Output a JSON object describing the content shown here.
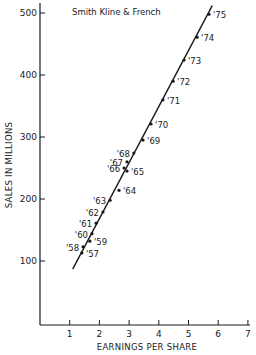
{
  "chart_data": {
    "type": "scatter",
    "title": "Smith Kline & French",
    "xlabel": "EARNINGS PER SHARE",
    "ylabel": "SALES IN MILLIONS",
    "xlim": [
      0,
      7
    ],
    "ylim": [
      0,
      500
    ],
    "xticks": [
      1,
      2,
      3,
      4,
      5,
      6,
      7
    ],
    "yticks": [
      100,
      200,
      300,
      400,
      500
    ],
    "grid": false,
    "legend": null,
    "series": [
      {
        "name": "Smith Kline & French",
        "points": [
          {
            "label": "'57",
            "x": 1.41,
            "y": 113
          },
          {
            "label": "'58",
            "x": 1.45,
            "y": 123
          },
          {
            "label": "'59",
            "x": 1.68,
            "y": 132
          },
          {
            "label": "'60",
            "x": 1.75,
            "y": 144
          },
          {
            "label": "'61",
            "x": 1.89,
            "y": 161
          },
          {
            "label": "'62",
            "x": 2.12,
            "y": 179
          },
          {
            "label": "'63",
            "x": 2.36,
            "y": 198
          },
          {
            "label": "'64",
            "x": 2.66,
            "y": 214
          },
          {
            "label": "'65",
            "x": 2.93,
            "y": 245
          },
          {
            "label": "'66",
            "x": 2.83,
            "y": 250
          },
          {
            "label": "'67",
            "x": 2.93,
            "y": 260
          },
          {
            "label": "'68",
            "x": 3.16,
            "y": 274
          },
          {
            "label": "'69",
            "x": 3.47,
            "y": 295
          },
          {
            "label": "'70",
            "x": 3.74,
            "y": 321
          },
          {
            "label": "'71",
            "x": 4.14,
            "y": 360
          },
          {
            "label": "'72",
            "x": 4.48,
            "y": 390
          },
          {
            "label": "'73",
            "x": 4.85,
            "y": 424
          },
          {
            "label": "'74",
            "x": 5.29,
            "y": 461
          },
          {
            "label": "'75",
            "x": 5.69,
            "y": 498
          }
        ]
      }
    ],
    "trend_line": {
      "x1": 1.1,
      "y1": 87,
      "x2": 5.8,
      "y2": 512
    },
    "annotations": []
  },
  "layout": {
    "label_side": {
      "'57": "right",
      "'58": "left",
      "'59": "right",
      "'60": "left",
      "'61": "left",
      "'62": "left",
      "'63": "left",
      "'64": "right",
      "'65": "right",
      "'66": "left",
      "'67": "left",
      "'68": "left",
      "'69": "right",
      "'70": "right",
      "'71": "right",
      "'72": "right",
      "'73": "right",
      "'74": "right",
      "'75": "right"
    }
  }
}
